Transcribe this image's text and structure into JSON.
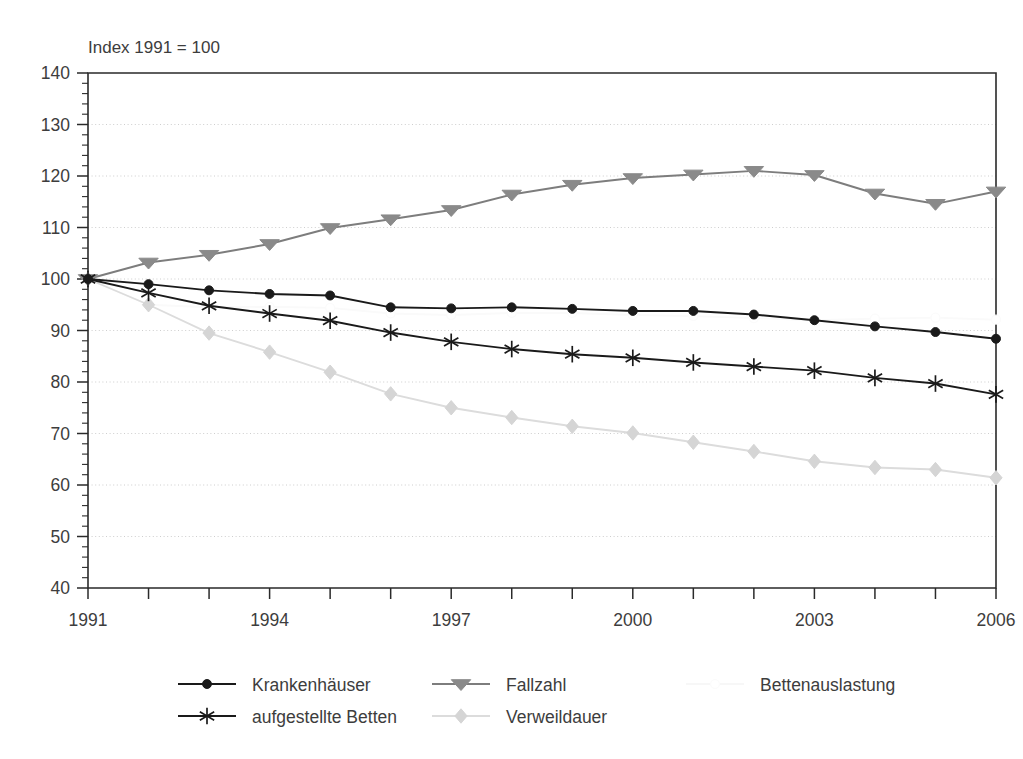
{
  "chart_data": {
    "type": "line",
    "title": "Index 1991 = 100",
    "xlabel": "",
    "ylabel": "",
    "xlim": [
      1991,
      2006
    ],
    "ylim": [
      40,
      140
    ],
    "ytick_step": 10,
    "yminor_step": 2,
    "xtick_step": 1,
    "xlabel_step": 3,
    "grid": true,
    "legend_position": "bottom",
    "x": [
      1991,
      1992,
      1993,
      1994,
      1995,
      1996,
      1997,
      1998,
      1999,
      2000,
      2001,
      2002,
      2003,
      2004,
      2005,
      2006
    ],
    "xtick_labels": [
      "1991",
      "",
      "",
      "1994",
      "",
      "",
      "1997",
      "",
      "",
      "2000",
      "",
      "",
      "2003",
      "",
      "",
      "2006"
    ],
    "ytick_labels": [
      "40",
      "50",
      "60",
      "70",
      "80",
      "90",
      "100",
      "110",
      "120",
      "130",
      "140"
    ],
    "ytick_values": [
      40,
      50,
      60,
      70,
      80,
      90,
      100,
      110,
      120,
      130,
      140
    ],
    "series": [
      {
        "name": "Krankenhäuser",
        "marker": "circle",
        "color": "#1a1a1a",
        "line_color": "#1a1a1a",
        "values": [
          100.0,
          99.0,
          97.8,
          97.1,
          96.8,
          94.5,
          94.3,
          94.5,
          94.2,
          93.8,
          93.8,
          93.1,
          92.0,
          90.8,
          89.7,
          88.4
        ]
      },
      {
        "name": "Fallzahl",
        "marker": "triangle-down",
        "color": "#8a8a8a",
        "line_color": "#7d7d7d",
        "values": [
          100.0,
          103.2,
          104.7,
          106.8,
          109.9,
          111.6,
          113.4,
          116.4,
          118.3,
          119.6,
          120.3,
          121.0,
          120.2,
          116.6,
          114.6,
          117.0
        ]
      },
      {
        "name": "aufgestellte Betten",
        "marker": "asterisk",
        "color": "#1a1a1a",
        "line_color": "#1a1a1a",
        "values": [
          100.0,
          97.3,
          94.8,
          93.3,
          91.9,
          89.6,
          87.8,
          86.4,
          85.4,
          84.7,
          83.8,
          83.0,
          82.2,
          80.8,
          79.7,
          77.6
        ]
      },
      {
        "name": "Verweildauer",
        "marker": "diamond",
        "color": "#d5d5d5",
        "line_color": "#dcdcdc",
        "values": [
          100.0,
          95.0,
          89.5,
          85.8,
          81.9,
          77.7,
          75.0,
          73.1,
          71.4,
          70.1,
          68.3,
          66.5,
          64.6,
          63.4,
          63.0,
          61.4
        ]
      },
      {
        "name": "Bettenauslastung",
        "marker": "circle-open",
        "color": "#fbfbfb",
        "line_color": "#fafafa",
        "values": [
          100.0,
          95.0,
          94.5,
          94.6,
          94.4,
          93.3,
          93.0,
          93.4,
          93.4,
          93.0,
          92.8,
          92.4,
          92.0,
          92.3,
          92.5,
          92.1
        ]
      }
    ]
  },
  "legend": {
    "entries": [
      {
        "label": "Krankenhäuser",
        "marker": "circle",
        "color": "#1a1a1a",
        "line_color": "#1a1a1a"
      },
      {
        "label": "Fallzahl",
        "marker": "triangle-down",
        "color": "#8a8a8a",
        "line_color": "#7d7d7d"
      },
      {
        "label": "Bettenauslastung",
        "marker": "circle-open",
        "color": "#fbfbfb",
        "line_color": "#f7f7f7"
      },
      {
        "label": "aufgestellte Betten",
        "marker": "asterisk",
        "color": "#1a1a1a",
        "line_color": "#1a1a1a"
      },
      {
        "label": "Verweildauer",
        "marker": "diamond",
        "color": "#d5d5d5",
        "line_color": "#dcdcdc"
      }
    ]
  }
}
